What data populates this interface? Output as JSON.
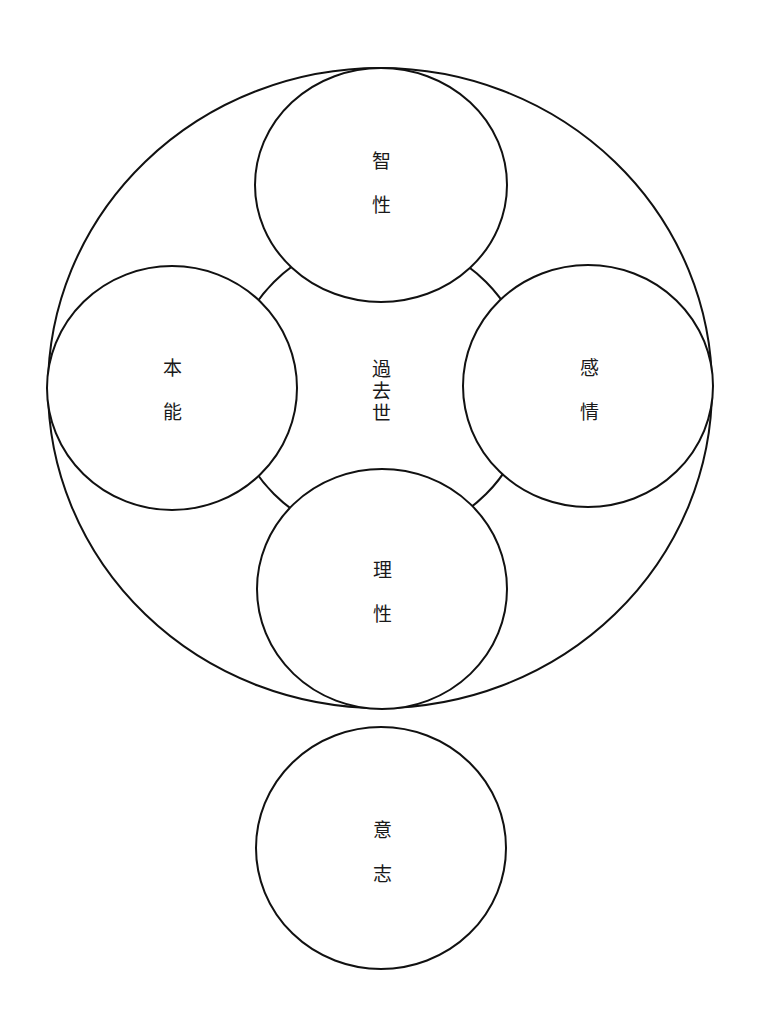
{
  "diagram": {
    "title": "",
    "stroke_color": "#111111",
    "background": "#ffffff",
    "outer": {
      "cx": 380,
      "cy": 388,
      "rx": 332,
      "ry": 320
    },
    "middle_ring": {
      "cx": 380,
      "cy": 388,
      "r": 150
    },
    "center": {
      "label": "過去世",
      "chars": [
        "過",
        "去",
        "世"
      ],
      "x": 381,
      "y": 390
    },
    "nodes": [
      {
        "id": "top",
        "label": "智性",
        "chars": [
          "智",
          "性"
        ],
        "cx": 381,
        "cy": 185,
        "rx": 126,
        "ry": 117
      },
      {
        "id": "left",
        "label": "本能",
        "chars": [
          "本",
          "能"
        ],
        "cx": 172,
        "cy": 388,
        "rx": 125,
        "ry": 122
      },
      {
        "id": "right",
        "label": "感情",
        "chars": [
          "感",
          "情"
        ],
        "cx": 588,
        "cy": 386,
        "rx": 125,
        "ry": 121
      },
      {
        "id": "bottom",
        "label": "理性",
        "chars": [
          "理",
          "性"
        ],
        "cx": 382,
        "cy": 589,
        "rx": 125,
        "ry": 120
      },
      {
        "id": "will",
        "label": "意志",
        "chars": [
          "意",
          "志"
        ],
        "cx": 381,
        "cy": 848,
        "rx": 125,
        "ry": 121
      }
    ],
    "edges": [
      {
        "from": "center",
        "to": "top"
      },
      {
        "from": "center",
        "to": "left"
      },
      {
        "from": "center",
        "to": "right"
      },
      {
        "from": "center",
        "to": "bottom"
      }
    ]
  }
}
